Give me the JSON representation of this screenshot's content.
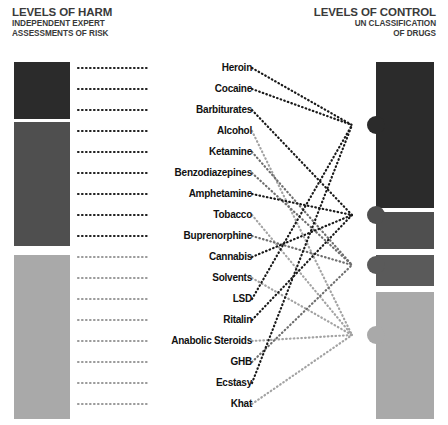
{
  "header": {
    "left": {
      "title": "LEVELS OF HARM",
      "subtitle_line1": "INDEPENDENT EXPERT",
      "subtitle_line2": "ASSESSMENTS OF RISK"
    },
    "right": {
      "title": "LEVELS OF CONTROL",
      "subtitle_line1": "UN CLASSIFICATION",
      "subtitle_line2": "OF DRUGS"
    }
  },
  "harm_levels": [
    {
      "id": "score-high",
      "label": "SCORE\n>2",
      "color": "#2b2b2b",
      "top": 62,
      "height": 57
    },
    {
      "id": "score-mid",
      "label": "SCORE\n1.5–2",
      "color": "#4f4f4f",
      "top": 122,
      "height": 124
    },
    {
      "id": "score-low",
      "label": "SCORE\n<1.5",
      "color": "#a9a9a9",
      "top": 255,
      "height": 164
    }
  ],
  "control_levels": [
    {
      "id": "most-dangerous",
      "label": "MOST\nDANGEROUS",
      "color": "#2b2b2b",
      "text": "#ffffff",
      "top": 62,
      "height": 146,
      "node_y": 125
    },
    {
      "id": "moderate-risk",
      "label": "MODERATE\nRISK",
      "color": "#4f4f4f",
      "text": "#ffffff",
      "top": 212,
      "height": 37,
      "node_y": 215
    },
    {
      "id": "low-risk",
      "label": "LOW RISK",
      "color": "#5a5a5a",
      "text": "#ffffff",
      "top": 255,
      "height": 31,
      "node_y": 265
    },
    {
      "id": "not-subject",
      "label": "NOT\nSUBJECT\nTO\nINTER-\nNATIONAL\nCONTROL",
      "color": "#a9a9a9",
      "text": "#111111",
      "top": 292,
      "height": 127,
      "node_y": 335
    }
  ],
  "drugs": [
    {
      "name": "Heroin",
      "y": 68,
      "harm": "score-high",
      "control": "most-dangerous"
    },
    {
      "name": "Cocaine",
      "y": 89,
      "harm": "score-high",
      "control": "most-dangerous"
    },
    {
      "name": "Barbiturates",
      "y": 110,
      "harm": "score-high",
      "control": "moderate-risk"
    },
    {
      "name": "Alcohol",
      "y": 131,
      "harm": "score-mid",
      "control": "not-subject"
    },
    {
      "name": "Ketamine",
      "y": 152,
      "harm": "score-mid",
      "control": "low-risk"
    },
    {
      "name": "Benzodiazepines",
      "y": 173,
      "harm": "score-mid",
      "control": "low-risk"
    },
    {
      "name": "Amphetamine",
      "y": 194,
      "harm": "score-mid",
      "control": "moderate-risk"
    },
    {
      "name": "Tobacco",
      "y": 215,
      "harm": "score-mid",
      "control": "not-subject"
    },
    {
      "name": "Buprenorphine",
      "y": 236,
      "harm": "score-mid",
      "control": "low-risk"
    },
    {
      "name": "Cannabis",
      "y": 257,
      "harm": "score-low",
      "control": "moderate-risk"
    },
    {
      "name": "Solvents",
      "y": 278,
      "harm": "score-low",
      "control": "not-subject"
    },
    {
      "name": "LSD",
      "y": 299,
      "harm": "score-low",
      "control": "most-dangerous"
    },
    {
      "name": "Ritalin",
      "y": 320,
      "harm": "score-low",
      "control": "moderate-risk"
    },
    {
      "name": "Anabolic Steroids",
      "y": 341,
      "harm": "score-low",
      "control": "not-subject"
    },
    {
      "name": "GHB",
      "y": 362,
      "harm": "score-low",
      "control": "low-risk"
    },
    {
      "name": "Ecstasy",
      "y": 383,
      "harm": "score-low",
      "control": "most-dangerous"
    },
    {
      "name": "Khat",
      "y": 404,
      "harm": "score-low",
      "control": "not-subject"
    }
  ],
  "geometry": {
    "left_leader_x_start": 78,
    "left_leader_x_end": 148,
    "right_node_x": 352,
    "right_label_gap_x": 252
  }
}
